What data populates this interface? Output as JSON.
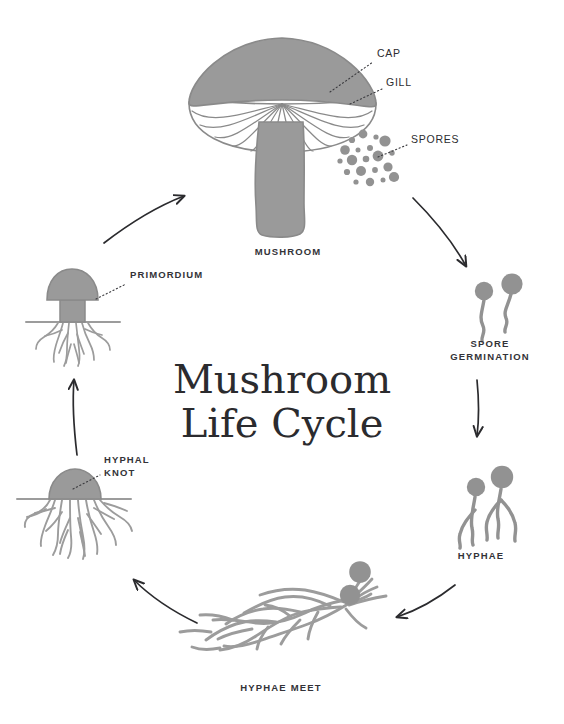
{
  "title": {
    "line1": "Mushroom",
    "line2": "Life Cycle"
  },
  "colors": {
    "background": "#ffffff",
    "organism_fill": "#9a9a9a",
    "organism_stroke": "#8a8a8a",
    "gill_white": "#ffffff",
    "arrow": "#2b2b2e",
    "label_text": "#333338",
    "leader_line": "#3a3a3e",
    "title_text": "#2b2b2e"
  },
  "stages": [
    {
      "id": "mushroom",
      "label": "MUSHROOM",
      "position": "top",
      "label_x": 288,
      "label_y": 255
    },
    {
      "id": "spore-germination",
      "label_line1": "SPORE",
      "label_line2": "GERMINATION",
      "position": "right-upper",
      "label_x": 490,
      "label_y": 347
    },
    {
      "id": "hyphae",
      "label": "HYPHAE",
      "position": "right-lower",
      "label_x": 481,
      "label_y": 559
    },
    {
      "id": "hyphae-meet",
      "label": "HYPHAE MEET",
      "position": "bottom",
      "label_x": 281,
      "label_y": 691
    },
    {
      "id": "hyphal-knot",
      "label_line1": "HYPHAL",
      "label_line2": "KNOT",
      "position": "left-lower",
      "label_x": 104,
      "label_y": 463
    },
    {
      "id": "primordium",
      "label": "PRIMORDIUM",
      "position": "left-upper",
      "label_x": 130,
      "label_y": 278
    }
  ],
  "callouts": [
    {
      "id": "cap",
      "label": "CAP",
      "label_x": 377,
      "label_y": 57,
      "leader_from_x": 373,
      "leader_from_y": 62,
      "leader_to_x": 330,
      "leader_to_y": 92
    },
    {
      "id": "gill",
      "label": "GILL",
      "label_x": 386,
      "label_y": 86,
      "leader_from_x": 382,
      "leader_from_y": 91,
      "leader_to_x": 350,
      "leader_to_y": 104
    },
    {
      "id": "spores",
      "label": "SPORES",
      "label_x": 411,
      "label_y": 143,
      "leader_from_x": 407,
      "leader_from_y": 147,
      "leader_to_x": 378,
      "leader_to_y": 157
    },
    {
      "id": "primordium-callout",
      "label": "PRIMORDIUM",
      "leader_from_x": 126,
      "leader_from_y": 283,
      "leader_to_x": 97,
      "leader_to_y": 300
    },
    {
      "id": "hyphal-knot-callout",
      "label": "HYPHAL KNOT",
      "leader_from_x": 100,
      "leader_from_y": 475,
      "leader_to_x": 73,
      "leader_to_y": 489
    }
  ],
  "arrows": [
    {
      "id": "arrow-mushroom-to-spore-germination",
      "from_stage": "mushroom",
      "to_stage": "spore-germination"
    },
    {
      "id": "arrow-spore-germination-to-hyphae",
      "from_stage": "spore-germination",
      "to_stage": "hyphae"
    },
    {
      "id": "arrow-hyphae-to-hyphae-meet",
      "from_stage": "hyphae",
      "to_stage": "hyphae-meet"
    },
    {
      "id": "arrow-hyphae-meet-to-hyphal-knot",
      "from_stage": "hyphae-meet",
      "to_stage": "hyphal-knot"
    },
    {
      "id": "arrow-hyphal-knot-to-primordium",
      "from_stage": "hyphal-knot",
      "to_stage": "primordium"
    },
    {
      "id": "arrow-primordium-to-mushroom",
      "from_stage": "primordium",
      "to_stage": "mushroom"
    }
  ]
}
